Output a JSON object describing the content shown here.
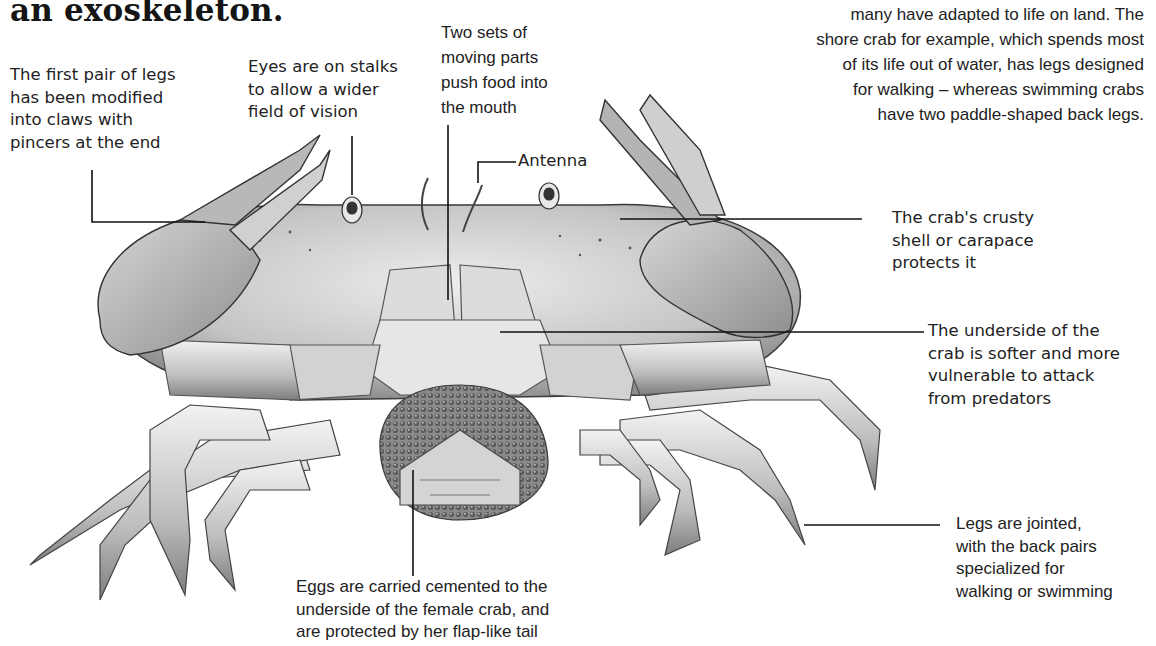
{
  "page": {
    "heading": "an exoskeleton.",
    "intro_paragraph": [
      "many have adapted to life on land. The",
      "shore crab for example, which spends most",
      "of its life out of water, has legs designed",
      "for walking – whereas swimming crabs",
      "have two paddle-shaped back legs."
    ]
  },
  "illustration": {
    "subject": "crab-underside-illustration",
    "colors": {
      "shell": "#c9c9c9",
      "shade": "#8a8a8a",
      "outline": "#3a3a3a",
      "eggs": "#6e6e6e"
    }
  },
  "annotations": {
    "claws": [
      "The first pair of legs",
      "has been modified",
      "into claws with",
      "pincers at the end"
    ],
    "eyes": [
      "Eyes are on stalks",
      "to allow a wider",
      "field of vision"
    ],
    "mouthparts": [
      "Two sets of",
      "moving parts",
      "push food into",
      "the mouth"
    ],
    "antenna": [
      "Antenna"
    ],
    "carapace": [
      "The crab's crusty",
      "shell or carapace",
      "protects it"
    ],
    "underside": [
      "The underside of the",
      "crab is softer and more",
      "vulnerable to attack",
      "from predators"
    ],
    "legs": [
      "Legs are jointed,",
      "with the back pairs",
      "specialized for",
      "walking or swimming"
    ],
    "eggs": [
      "Eggs are carried cemented to the",
      "underside of the female crab, and",
      "are protected by her flap-like tail"
    ]
  }
}
